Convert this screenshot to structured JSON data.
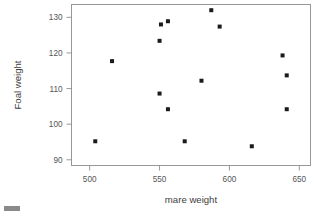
{
  "chart_data": {
    "type": "scatter",
    "title": "",
    "subtitle": "",
    "xlabel": "mare weight",
    "ylabel": "Foal weight",
    "xlim": [
      487,
      658
    ],
    "ylim": [
      88.4,
      133.6
    ],
    "xticks": [
      500,
      550,
      600,
      650
    ],
    "xticklabels": [
      "500",
      "550",
      "600",
      "650"
    ],
    "yticks": [
      90,
      100,
      110,
      120,
      130
    ],
    "yticklabels": [
      "90",
      "100",
      "110",
      "120",
      "130"
    ],
    "grid": false,
    "legend": null,
    "marker": "square",
    "marker_color": "#1b1b1b",
    "marker_size": 4,
    "series": [
      {
        "name": "foal vs mare weight",
        "points": [
          {
            "x": 504,
            "y": 95.2
          },
          {
            "x": 516,
            "y": 117.7
          },
          {
            "x": 550,
            "y": 108.6
          },
          {
            "x": 550,
            "y": 123.4
          },
          {
            "x": 551,
            "y": 128.0
          },
          {
            "x": 556,
            "y": 128.9
          },
          {
            "x": 556,
            "y": 104.2
          },
          {
            "x": 568,
            "y": 95.2
          },
          {
            "x": 580,
            "y": 112.2
          },
          {
            "x": 587,
            "y": 132.0
          },
          {
            "x": 593,
            "y": 127.4
          },
          {
            "x": 616,
            "y": 93.8
          },
          {
            "x": 638,
            "y": 119.3
          },
          {
            "x": 641,
            "y": 113.7
          },
          {
            "x": 641,
            "y": 104.2
          }
        ]
      }
    ]
  },
  "axes": {
    "x_title": "mare weight",
    "y_title": "Foal weight"
  },
  "artifact": {
    "corner_mark_color": "#8a8a8a"
  }
}
